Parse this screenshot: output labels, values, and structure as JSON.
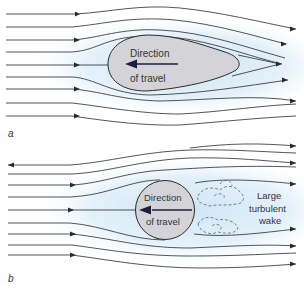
{
  "figure": {
    "panel_a": {
      "letter": "a",
      "body_shape": "teardrop",
      "label_line1": "Direction",
      "label_line2": "of travel"
    },
    "panel_b": {
      "letter": "b",
      "body_shape": "circle",
      "label_line1": "Direction",
      "label_line2": "of travel",
      "wake_line1": "Large",
      "wake_line2": "turbulent",
      "wake_line3": "wake"
    },
    "colors": {
      "streamline": "#2a2a2a",
      "body_fill": "#d4d4d8",
      "flow_shade": "#dcecf7",
      "direction_arrow": "#1e1e3c"
    }
  }
}
